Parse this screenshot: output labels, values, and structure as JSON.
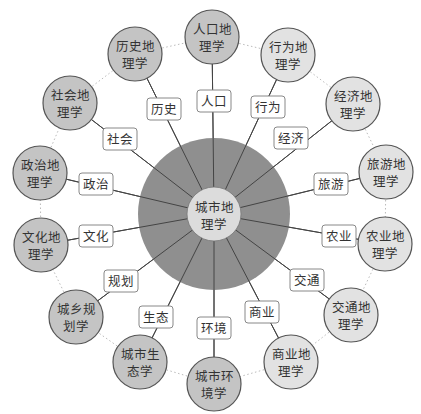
{
  "diagram": {
    "type": "radial-concept-map",
    "center": {
      "label_line1": "城市地",
      "label_line2": "理学",
      "x": 214,
      "y": 214,
      "outer_radius": 76,
      "inner_radius": 27
    },
    "colors": {
      "outer_ring": "#8f8f8f",
      "inner_circle": "#dcdcdc",
      "dark_node": "#c4c4c4",
      "light_node": "#e2e2e2",
      "node_stroke": "#555555",
      "spoke": "#444444",
      "label_box_stroke": "#888888",
      "dotted_ring": "#bbbbbb",
      "text": "#333333"
    },
    "nodes": [
      {
        "line1": "人口地",
        "line2": "理学",
        "x": 212,
        "y": 37,
        "shade": "dark",
        "edge_label": "人口",
        "lx": 214,
        "ly": 101
      },
      {
        "line1": "行为地",
        "line2": "理学",
        "x": 288,
        "y": 55,
        "shade": "light",
        "edge_label": "行为",
        "lx": 268,
        "ly": 107
      },
      {
        "line1": "经济地",
        "line2": "理学",
        "x": 353,
        "y": 104,
        "shade": "light",
        "edge_label": "经济",
        "lx": 291,
        "ly": 138
      },
      {
        "line1": "旅游地",
        "line2": "理学",
        "x": 386,
        "y": 172,
        "shade": "light",
        "edge_label": "旅游",
        "lx": 331,
        "ly": 184
      },
      {
        "line1": "农业地",
        "line2": "理学",
        "x": 385,
        "y": 244,
        "shade": "light",
        "edge_label": "农业",
        "lx": 339,
        "ly": 236
      },
      {
        "line1": "交通地",
        "line2": "理学",
        "x": 351,
        "y": 315,
        "shade": "light",
        "edge_label": "交通",
        "lx": 307,
        "ly": 280
      },
      {
        "line1": "商业地",
        "line2": "理学",
        "x": 291,
        "y": 362,
        "shade": "light",
        "edge_label": "商业",
        "lx": 262,
        "ly": 312
      },
      {
        "line1": "城市环",
        "line2": "境学",
        "x": 214,
        "y": 384,
        "shade": "dark",
        "edge_label": "环境",
        "lx": 214,
        "ly": 328
      },
      {
        "line1": "城市生",
        "line2": "态学",
        "x": 140,
        "y": 362,
        "shade": "dark",
        "edge_label": "生态",
        "lx": 156,
        "ly": 317
      },
      {
        "line1": "城乡规",
        "line2": "划学",
        "x": 76,
        "y": 317,
        "shade": "dark",
        "edge_label": "规划",
        "lx": 121,
        "ly": 281
      },
      {
        "line1": "文化地",
        "line2": "理学",
        "x": 41,
        "y": 245,
        "shade": "dark",
        "edge_label": "文化",
        "lx": 96,
        "ly": 236
      },
      {
        "line1": "政治地",
        "line2": "理学",
        "x": 40,
        "y": 173,
        "shade": "dark",
        "edge_label": "政治",
        "lx": 96,
        "ly": 184
      },
      {
        "line1": "社会地",
        "line2": "理学",
        "x": 70,
        "y": 103,
        "shade": "dark",
        "edge_label": "社会",
        "lx": 120,
        "ly": 139
      },
      {
        "line1": "历史地",
        "line2": "理学",
        "x": 135,
        "y": 54,
        "shade": "dark",
        "edge_label": "历史",
        "lx": 164,
        "ly": 109
      }
    ]
  }
}
